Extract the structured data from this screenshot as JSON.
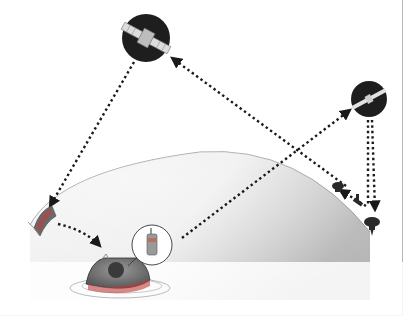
{
  "diagram": {
    "type": "satellite-search-and-rescue",
    "nodes": [
      {
        "id": "satellite-leo",
        "label": "",
        "icon": "satellite-icon",
        "x": 146,
        "y": 38,
        "r": 24
      },
      {
        "id": "satellite-geo",
        "label": "",
        "icon": "satellite-icon",
        "x": 369,
        "y": 99,
        "r": 18
      },
      {
        "id": "ground-station",
        "label": "",
        "icon": "ground-station-icon",
        "x": 355,
        "y": 200
      },
      {
        "id": "mission-control",
        "label": "",
        "icon": "antenna-dish-icon",
        "x": 42,
        "y": 222
      },
      {
        "id": "capsule",
        "label": "",
        "icon": "capsule-icon",
        "x": 118,
        "y": 278
      },
      {
        "id": "beacon",
        "label": "",
        "icon": "radio-beacon-icon",
        "x": 152,
        "y": 246
      }
    ],
    "links": [
      {
        "from": "satellite-leo",
        "to": "mission-control",
        "style": "dotted-arrow"
      },
      {
        "from": "ground-station",
        "to": "satellite-leo",
        "style": "dotted-arrow"
      },
      {
        "from": "beacon",
        "to": "satellite-geo",
        "style": "dotted-arrow"
      },
      {
        "from": "satellite-geo",
        "to": "ground-station",
        "style": "dotted-arrow"
      },
      {
        "from": "mission-control",
        "to": "capsule",
        "style": "dotted-arrow"
      }
    ],
    "colors": {
      "earth_light": "#f4f4f4",
      "earth_dark": "#bdbdbd",
      "satellite_bg": "#1e1e1e",
      "arrow": "#1a1a1a",
      "frame": "#b8b8b8"
    }
  }
}
